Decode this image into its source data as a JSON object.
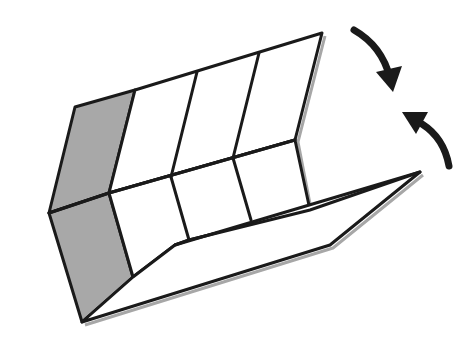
{
  "diagram": {
    "colors": {
      "line": "#1a1a1a",
      "shade": "#a8a8a8",
      "shadow": "#8a8a8a",
      "background": "#ffffff",
      "arrow": "#1a1a1a"
    },
    "panels": {
      "back_panels": 4,
      "bottom_panels": 4,
      "front_flap": 1,
      "shaded_panels": [
        "end-panel-upper",
        "end-panel-lower"
      ]
    },
    "arrows": [
      {
        "name": "fold-down-arrow",
        "direction": "clockwise-down"
      },
      {
        "name": "fold-up-arrow",
        "direction": "counterclockwise-up"
      }
    ]
  }
}
